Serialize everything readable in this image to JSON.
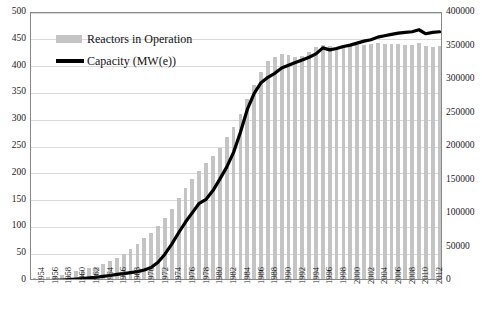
{
  "chart_data": {
    "type": "bar",
    "title": "",
    "subtitle": "",
    "xlabel": "",
    "ylabel": "",
    "y2label": "",
    "grid": true,
    "legend_position": "top-left",
    "x": [
      1954,
      1955,
      1956,
      1957,
      1958,
      1959,
      1960,
      1961,
      1962,
      1963,
      1964,
      1965,
      1966,
      1967,
      1968,
      1969,
      1970,
      1971,
      1972,
      1973,
      1974,
      1975,
      1976,
      1977,
      1978,
      1979,
      1980,
      1981,
      1982,
      1983,
      1984,
      1985,
      1986,
      1987,
      1988,
      1989,
      1990,
      1991,
      1992,
      1993,
      1994,
      1995,
      1996,
      1997,
      1998,
      1999,
      2000,
      2001,
      2002,
      2003,
      2004,
      2005,
      2006,
      2007,
      2008,
      2009,
      2010,
      2011,
      2012,
      2013
    ],
    "categories": [
      "1954",
      "1955",
      "1956",
      "1957",
      "1958",
      "1959",
      "1960",
      "1961",
      "1962",
      "1963",
      "1964",
      "1965",
      "1966",
      "1967",
      "1968",
      "1969",
      "1970",
      "1971",
      "1972",
      "1973",
      "1974",
      "1975",
      "1976",
      "1977",
      "1978",
      "1979",
      "1980",
      "1981",
      "1982",
      "1983",
      "1984",
      "1985",
      "1986",
      "1987",
      "1988",
      "1989",
      "1990",
      "1991",
      "1992",
      "1993",
      "1994",
      "1995",
      "1996",
      "1997",
      "1998",
      "1999",
      "2000",
      "2001",
      "2002",
      "2003",
      "2004",
      "2005",
      "2006",
      "2007",
      "2008",
      "2009",
      "2010",
      "2011",
      "2012",
      "2013"
    ],
    "tick_labels_x": [
      "1954",
      "1956",
      "1958",
      "1960",
      "1962",
      "1964",
      "1966",
      "1968",
      "1970",
      "1972",
      "1974",
      "1976",
      "1978",
      "1980",
      "1982",
      "1984",
      "1986",
      "1988",
      "1990",
      "1992",
      "1994",
      "1996",
      "1998",
      "2000",
      "2002",
      "2004",
      "2006",
      "2008",
      "2010",
      "2012"
    ],
    "tick_labels_y_left": [
      "0",
      "50",
      "100",
      "150",
      "200",
      "250",
      "300",
      "350",
      "400",
      "450",
      "500"
    ],
    "tick_labels_y_right": [
      "0",
      "50000",
      "100000",
      "150000",
      "200000",
      "250000",
      "300000",
      "350000",
      "400000"
    ],
    "ylim": [
      0,
      500
    ],
    "y2lim": [
      0,
      400000
    ],
    "series": [
      {
        "name": "Reactors in Operation",
        "type": "bar",
        "axis": "left",
        "color": "#c4c4c4",
        "values": [
          1,
          2,
          3,
          5,
          8,
          10,
          15,
          17,
          20,
          23,
          28,
          33,
          39,
          47,
          56,
          66,
          76,
          85,
          99,
          113,
          131,
          151,
          170,
          187,
          202,
          217,
          230,
          245,
          265,
          284,
          307,
          336,
          362,
          387,
          407,
          415,
          420,
          418,
          415,
          416,
          423,
          432,
          437,
          434,
          432,
          433,
          435,
          436,
          437,
          438,
          440,
          439,
          438,
          438,
          437,
          436,
          440,
          434,
          433,
          434
        ]
      },
      {
        "name": "Capacity (MW(e))",
        "type": "line",
        "axis": "right",
        "color": "#000000",
        "values": [
          0,
          200,
          500,
          900,
          1500,
          2100,
          2800,
          3600,
          4600,
          5600,
          6800,
          8200,
          9800,
          11000,
          12500,
          14000,
          16500,
          20000,
          28000,
          40000,
          55000,
          72000,
          88000,
          102000,
          116000,
          122000,
          135000,
          152000,
          170000,
          192000,
          222000,
          256000,
          280000,
          296000,
          304000,
          310000,
          318000,
          322000,
          326000,
          330000,
          334000,
          339000,
          348000,
          345000,
          347000,
          350000,
          352000,
          355000,
          358000,
          360000,
          364000,
          366000,
          368000,
          370000,
          371000,
          372000,
          375000,
          369000,
          371000,
          372000
        ]
      }
    ]
  },
  "legend": {
    "items": [
      {
        "label": "Reactors in Operation",
        "swatch": "bar"
      },
      {
        "label": "Capacity (MW(e))",
        "swatch": "line"
      }
    ]
  }
}
